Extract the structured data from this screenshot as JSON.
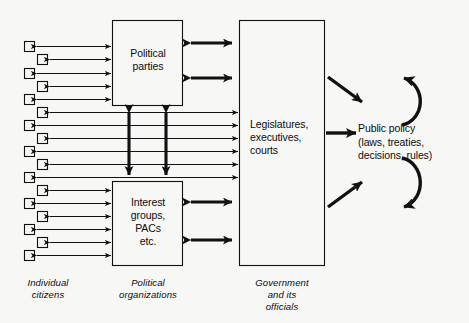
{
  "diagram": {
    "background_color": "#f7f7f5",
    "stroke_color": "#111111",
    "boxes": [
      {
        "id": "political-parties",
        "label": "Political\nparties",
        "x": 112,
        "y": 20,
        "w": 71,
        "h": 86
      },
      {
        "id": "interest-groups",
        "label": "Interest\ngroups,\nPACs\netc.",
        "x": 112,
        "y": 181,
        "w": 71,
        "h": 85
      },
      {
        "id": "government",
        "label": "Legislatures,\nexecutives,\ncourts",
        "x": 239,
        "y": 20,
        "w": 85,
        "h": 246
      }
    ],
    "box_labels": {
      "political_parties": "Political parties",
      "interest_groups": "Interest groups, PACs etc.",
      "government": "Legislatures, executives, courts"
    },
    "policy": {
      "line1": "Public policy",
      "line2": "(laws, treaties,",
      "line3": "decisions, rules)"
    },
    "captions": {
      "citizens": "Individual citizens",
      "citizens_line1": "Individual",
      "citizens_line2": "citizens",
      "organizations": "Political organizations",
      "organizations_line1": "Political",
      "organizations_line2": "organizations",
      "government": "Government and its officials",
      "government_line1": "Government",
      "government_line2": "and its",
      "government_line3": "officials"
    },
    "citizen_squares": {
      "count": 17,
      "size": 10,
      "x_left": 24,
      "x_right": 37,
      "y_start": 41,
      "y_step": 13.4,
      "note": "alternating zig-zag column of individual citizen boxes"
    },
    "connections": {
      "citizens_to_parties": 5,
      "citizens_to_government": 6,
      "citizens_to_interest_groups": 6,
      "parties_to_government_thick": 2,
      "interest_groups_to_government_thick": 2,
      "parties_to_interest_groups_vertical_thick": 2,
      "government_to_policy": 1,
      "feedback_loops": 2
    }
  }
}
